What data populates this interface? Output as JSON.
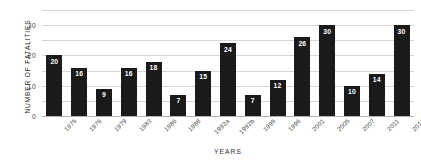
{
  "chart_data": {
    "type": "bar",
    "title": "",
    "xlabel": "YEARS",
    "ylabel": "NUMBER OF FATALITIES",
    "categories": [
      "1975",
      "1976",
      "1979",
      "1983",
      "1986",
      "1988",
      "1992a",
      "1992b",
      "1995",
      "1996",
      "2001",
      "2005",
      "2007",
      "2011",
      "2014"
    ],
    "values": [
      20,
      16,
      9,
      16,
      18,
      7,
      15,
      24,
      7,
      12,
      26,
      30,
      10,
      14,
      30
    ],
    "ylim": [
      0,
      35
    ],
    "yticks": [
      0,
      10,
      20,
      30
    ],
    "gridlines": [
      0,
      5,
      10,
      15,
      20,
      25,
      30,
      35
    ],
    "grid": true,
    "legend": "none",
    "bar_color": "#1a1a1a",
    "value_label_color": "#ffffff",
    "gridline_color": "#d6d6d6",
    "background_color": "#ffffff"
  }
}
